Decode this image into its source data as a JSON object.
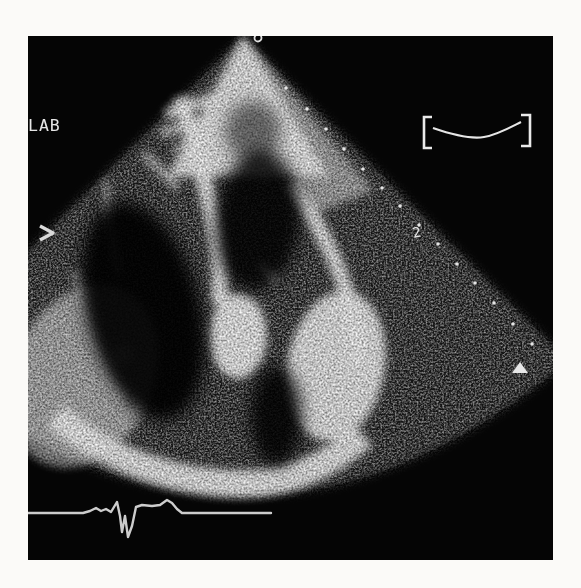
{
  "figure": {
    "kind": "echocardiogram-2d-sector-scan",
    "page_color": "#fbfaf8",
    "image_background": "#050505",
    "overlay_color": "#e6e6e6"
  },
  "overlay": {
    "lab_label": "LAB",
    "numeral_2": "2"
  },
  "markers": {
    "top_circle": {
      "cx": 230,
      "cy": 2,
      "r": 3.5
    },
    "focal_triangle_points": "484,337 500,337 492,326",
    "sector_edge_dots": [
      [
        258,
        52
      ],
      [
        279,
        73
      ],
      [
        298,
        93
      ],
      [
        316,
        113
      ],
      [
        335,
        133
      ],
      [
        354,
        152
      ],
      [
        372,
        170
      ],
      [
        391,
        189
      ],
      [
        410,
        208
      ],
      [
        429,
        228
      ],
      [
        447,
        247
      ],
      [
        466,
        267
      ],
      [
        485,
        288
      ],
      [
        504,
        308
      ]
    ]
  },
  "ecg": {
    "color": "#d8d8d8",
    "points": [
      [
        0,
        477
      ],
      [
        55,
        477
      ],
      [
        62,
        475
      ],
      [
        68,
        472
      ],
      [
        73,
        475
      ],
      [
        78,
        473
      ],
      [
        83,
        476
      ],
      [
        86,
        471
      ],
      [
        89,
        466
      ],
      [
        92,
        480
      ],
      [
        94,
        496
      ],
      [
        97,
        480
      ],
      [
        100,
        501
      ],
      [
        104,
        490
      ],
      [
        108,
        471
      ],
      [
        114,
        469
      ],
      [
        124,
        470
      ],
      [
        132,
        469
      ],
      [
        139,
        464
      ],
      [
        144,
        467
      ],
      [
        149,
        473
      ],
      [
        154,
        477
      ],
      [
        243,
        477
      ]
    ]
  }
}
